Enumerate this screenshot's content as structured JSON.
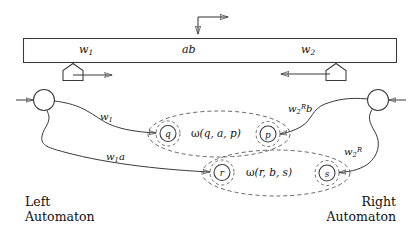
{
  "figure": {
    "colors": {
      "stroke": "#3a3a3a",
      "dashed": "#4a4a4a",
      "text": "#111111",
      "background": "#ffffff"
    }
  },
  "top_arrow": {
    "name": "head-direction-indicator",
    "horizontal_direction": "right",
    "vertical_direction": "down"
  },
  "tape": {
    "cells": [
      {
        "id": "left-word",
        "label": "w",
        "sub": "1",
        "sup": ""
      },
      {
        "id": "middle-word",
        "label": "ab",
        "sub": "",
        "sup": ""
      },
      {
        "id": "right-word",
        "label": "w",
        "sub": "2",
        "sup": ""
      }
    ],
    "left_head": {
      "name": "left-tape-head",
      "arrow_direction": "right"
    },
    "right_head": {
      "name": "right-tape-head",
      "arrow_direction": "left"
    }
  },
  "automata": {
    "left": {
      "line1": "Left",
      "line2": "Automaton"
    },
    "right": {
      "line1": "Right",
      "line2": "Automaton"
    }
  },
  "states": [
    {
      "id": "q",
      "label": "q"
    },
    {
      "id": "p",
      "label": "p"
    },
    {
      "id": "r",
      "label": "r"
    },
    {
      "id": "s",
      "label": "s"
    }
  ],
  "start_states": [
    {
      "id": "left-start-state",
      "side": "left"
    },
    {
      "id": "right-start-state",
      "side": "right"
    }
  ],
  "edges": [
    {
      "id": "left-to-q",
      "label": "w",
      "sub": "1",
      "sup": "",
      "suffix": "",
      "from": "left-start-state",
      "to": "q"
    },
    {
      "id": "left-to-r",
      "label": "w",
      "sub": "1",
      "sup": "",
      "suffix": "a",
      "from": "left-start-state",
      "to": "r"
    },
    {
      "id": "right-to-p",
      "label": "w",
      "sub": "2",
      "sup": "R",
      "suffix": "b",
      "from": "right-start-state",
      "to": "p"
    },
    {
      "id": "right-to-s",
      "label": "w",
      "sub": "2",
      "sup": "R",
      "suffix": "",
      "from": "right-start-state",
      "to": "s"
    }
  ],
  "groups": [
    {
      "id": "group-q-a-p",
      "omega": "ω",
      "args": "(q, a, p)",
      "members": [
        "q",
        "p"
      ]
    },
    {
      "id": "group-r-b-s",
      "omega": "ω",
      "args": "(r, b, s)",
      "members": [
        "r",
        "s"
      ]
    }
  ]
}
